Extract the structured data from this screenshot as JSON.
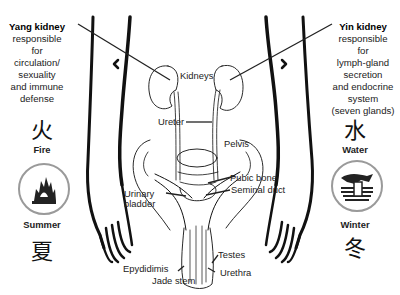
{
  "left_panel": {
    "title": "Yang kidney",
    "description_lines": [
      "responsible",
      "for",
      "circulation/",
      "sexuality",
      "and immune",
      "defense"
    ],
    "element_character": "火",
    "element_name": "Fire",
    "element_icon": "fire-icon",
    "season_name": "Summer",
    "season_character": "夏"
  },
  "right_panel": {
    "title": "Yin kidney",
    "description_lines": [
      "responsible",
      "for",
      "lymph-gland",
      "secretion",
      "and endocrine",
      "system",
      "(seven glands)"
    ],
    "element_character": "水",
    "element_name": "Water",
    "element_icon": "water-icon",
    "season_name": "Winter",
    "season_character": "冬"
  },
  "anatomy_labels": {
    "kidneys": "Kidneys",
    "ureter": "Ureter",
    "pelvis": "Pelvis",
    "pubic_bone": "Pubic bone",
    "seminal_duct": "Seminal duct",
    "urinary_bladder_line1": "Urinary",
    "urinary_bladder_line2": "bladder",
    "testes": "Testes",
    "epydidimis": "Epydidimis",
    "urethra": "Urethra",
    "jade_stem": "Jade stem"
  },
  "colors": {
    "line": "#111111",
    "badge_ring": "#9a9a9a"
  }
}
